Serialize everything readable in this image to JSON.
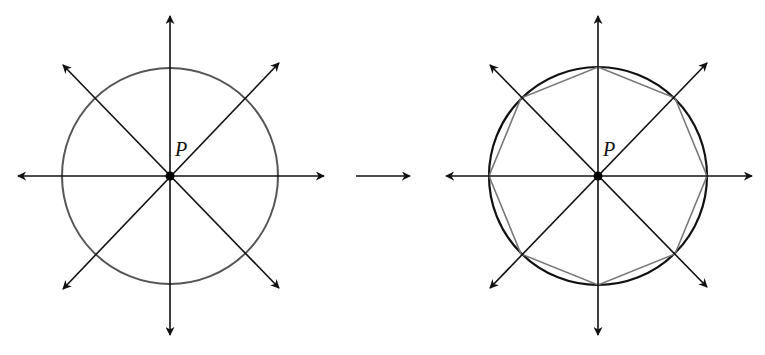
{
  "figure": {
    "left_panel": {
      "center_label": "P",
      "center": [
        170,
        176
      ],
      "circle_radius": 108,
      "ray_count": 8,
      "circle_color": "#555555"
    },
    "transition_arrow": {
      "from": [
        355,
        176
      ],
      "to": [
        410,
        176
      ]
    },
    "right_panel": {
      "center_label": "P",
      "center": [
        598,
        176
      ],
      "circle_radius": 109,
      "ray_count": 8,
      "polygon": "regular octagon inscribed in circle",
      "polygon_color": "#777777",
      "circle_color": "#111111"
    },
    "colors": {
      "ray": "#111111",
      "background": "#ffffff"
    }
  }
}
